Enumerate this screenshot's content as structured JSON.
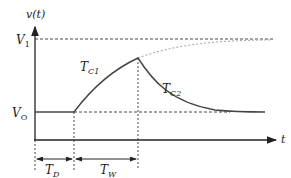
{
  "labels": {
    "y_axis": "v(t)",
    "x_axis": "t",
    "v1": "V",
    "v1_sub": "1",
    "vo": "V",
    "vo_sub": "O",
    "tc1": "T",
    "tc1_sub": "C1",
    "tc2": "T",
    "tc2_sub": "C2",
    "td": "T",
    "td_sub": "D",
    "tw": "T",
    "tw_sub": "W"
  },
  "colors": {
    "axis": "#222222",
    "curve": "#444444",
    "asymptote": "#aaaaaa"
  }
}
